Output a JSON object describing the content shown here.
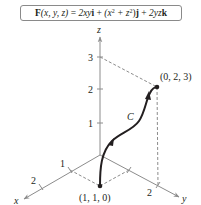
{
  "formula": {
    "lhs_symbol": "F",
    "lhs_args": "(x, y, z)",
    "equals": " = ",
    "term1_coeff": "2xy",
    "term1_unit": "i",
    "plus1": " + ",
    "term2_open": "(x",
    "term2_exp1": "2",
    "term2_mid": " + z",
    "term2_exp2": "2",
    "term2_close": ")",
    "term2_unit": "j",
    "plus2": " + ",
    "term3_coeff": "2yz",
    "term3_unit": "k",
    "full_text": "F(x, y, z) = 2xyi + (x² + z²)j + 2yzk"
  },
  "axes": {
    "x_label": "x",
    "y_label": "y",
    "z_label": "z",
    "x_ticks": [
      "1",
      "2"
    ],
    "y_ticks": [
      "1",
      "2"
    ],
    "z_ticks": [
      "1",
      "2",
      "3"
    ]
  },
  "curve": {
    "label": "C",
    "start_point_label": "(1, 1, 0)",
    "end_point_label": "(0, 2, 3)",
    "start_point": [
      1,
      1,
      0
    ],
    "end_point": [
      0,
      2,
      3
    ]
  },
  "colors": {
    "axis": "#8c8c8c",
    "dashed": "#8c8c8c",
    "curve": "#231f20",
    "text": "#231f20"
  }
}
